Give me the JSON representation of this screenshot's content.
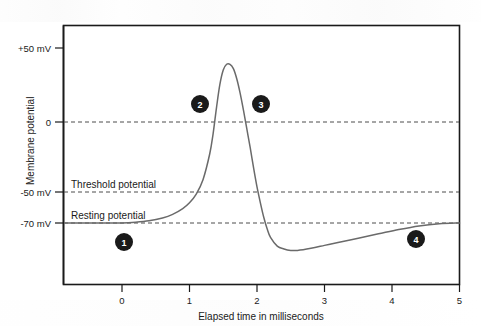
{
  "figure": {
    "title": "",
    "background": "#ffffff"
  },
  "axes": {
    "y_title": "Membrane potential",
    "x_title": "Elapsed time in milliseconds",
    "y_ticks": [
      {
        "label": "+50 mV",
        "value": 50
      },
      {
        "label": "0",
        "value": 0
      },
      {
        "label": "-50 mV",
        "value": -50
      },
      {
        "label": "-70 mV",
        "value": -70
      }
    ],
    "x_ticks": [
      {
        "label": "0",
        "value": 0
      },
      {
        "label": "1",
        "value": 1
      },
      {
        "label": "2",
        "value": 2
      },
      {
        "label": "3",
        "value": 3
      },
      {
        "label": "4",
        "value": 4
      },
      {
        "label": "5",
        "value": 5
      }
    ]
  },
  "annotations": {
    "threshold_label": "Threshold potential",
    "resting_label": "Resting potential"
  },
  "markers": [
    {
      "id": "1",
      "label": "1",
      "x": 0.9,
      "y": -85
    },
    {
      "id": "2",
      "label": "2",
      "x": 1.15,
      "y": 18
    },
    {
      "id": "3",
      "label": "3",
      "x": 2.05,
      "y": 18
    },
    {
      "id": "4",
      "label": "4",
      "x": 4.35,
      "y": -82
    }
  ],
  "colors": {
    "curve": "#6a6a6a",
    "frame": "#1a1a1a",
    "gridline": "#4d4d4d",
    "marker_fill": "#1a1a1a",
    "marker_text": "#ffffff"
  },
  "chart_data": {
    "type": "line",
    "title": "",
    "xlabel": "Elapsed time in milliseconds",
    "ylabel": "Membrane potential",
    "xlim": [
      -0.85,
      5.0
    ],
    "ylim": [
      -105,
      62
    ],
    "grid": true,
    "gridlines_y": [
      0,
      -50,
      -70
    ],
    "legend": "none",
    "series": [
      {
        "name": "Membrane potential",
        "x": [
          -0.85,
          -0.6,
          -0.3,
          0.0,
          0.2,
          0.4,
          0.6,
          0.75,
          0.9,
          1.0,
          1.1,
          1.2,
          1.3,
          1.35,
          1.4,
          1.45,
          1.5,
          1.55,
          1.6,
          1.65,
          1.7,
          1.75,
          1.8,
          1.85,
          1.9,
          1.95,
          2.0,
          2.05,
          2.1,
          2.15,
          2.2,
          2.3,
          2.4,
          2.5,
          2.6,
          2.8,
          3.0,
          3.2,
          3.5,
          3.8,
          4.1,
          4.4,
          4.7,
          5.0
        ],
        "y": [
          -70,
          -70,
          -70,
          -70,
          -69.5,
          -68.5,
          -66.5,
          -64,
          -60,
          -56,
          -50,
          -40,
          -22,
          -8,
          10,
          26,
          36,
          40,
          40,
          37,
          30,
          20,
          8,
          -5,
          -18,
          -32,
          -45,
          -56,
          -66,
          -74,
          -80,
          -86,
          -88,
          -89,
          -89,
          -87.5,
          -85.5,
          -83.5,
          -80.5,
          -77.5,
          -74.5,
          -72,
          -70.5,
          -70
        ]
      }
    ],
    "reference_lines": [
      {
        "label": "Threshold potential",
        "value": -50
      },
      {
        "label": "Resting potential",
        "value": -70
      },
      {
        "label": "",
        "value": 0
      }
    ],
    "annotated_points": [
      {
        "label": "1",
        "phase": "resting"
      },
      {
        "label": "2",
        "phase": "depolarization"
      },
      {
        "label": "3",
        "phase": "repolarization"
      },
      {
        "label": "4",
        "phase": "recovery"
      }
    ]
  }
}
